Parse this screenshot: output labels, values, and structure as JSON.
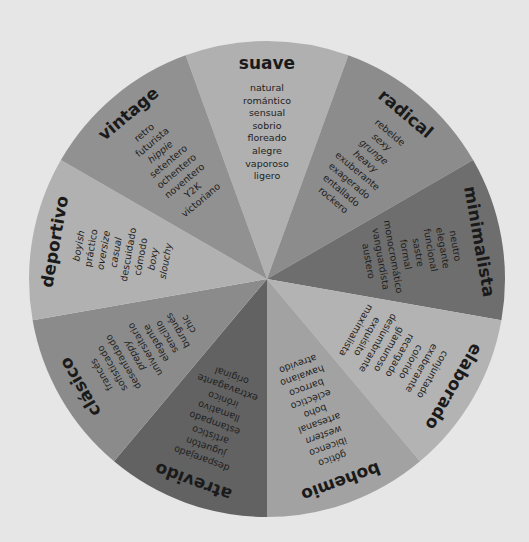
{
  "wheel": {
    "center": [
      267,
      279
    ],
    "radius": 238,
    "background": "#e6e6e6",
    "segments": [
      {
        "title": "suave",
        "angle": 0,
        "color": "#b0b0b0",
        "items": [
          {
            "t": "natural"
          },
          {
            "t": "romántico"
          },
          {
            "t": "sensual"
          },
          {
            "t": "sobrio"
          },
          {
            "t": "floreado"
          },
          {
            "t": "alegre"
          },
          {
            "t": "vaporoso"
          },
          {
            "t": "ligero"
          }
        ]
      },
      {
        "title": "radical",
        "angle": 40,
        "color": "#8c8c8c",
        "items": [
          {
            "t": "rebelde"
          },
          {
            "t": "sexy",
            "i": true
          },
          {
            "t": "grunge",
            "i": true
          },
          {
            "t": "heavy",
            "i": true
          },
          {
            "t": "exuberante"
          },
          {
            "t": "exagerado"
          },
          {
            "t": "entallado"
          },
          {
            "t": "rockero"
          }
        ]
      },
      {
        "title": "minimalista",
        "angle": 80,
        "color": "#6e6e6e",
        "items": [
          {
            "t": "neutro"
          },
          {
            "t": "elegante"
          },
          {
            "t": "funcional"
          },
          {
            "t": "sastre"
          },
          {
            "t": "formal"
          },
          {
            "t": "monocromático"
          },
          {
            "t": "vanguardista"
          },
          {
            "t": "austero"
          }
        ]
      },
      {
        "title": "elaborado",
        "angle": 120,
        "color": "#b3b3b3",
        "items": [
          {
            "t": "conjuntado"
          },
          {
            "t": "exuberante"
          },
          {
            "t": "colorido"
          },
          {
            "t": "recargado"
          },
          {
            "t": "glamuroso"
          },
          {
            "t": "deslumbrante"
          },
          {
            "t": "exquisito"
          },
          {
            "t": "maximalista"
          }
        ]
      },
      {
        "title": "bohemio",
        "angle": 160,
        "color": "#a2a2a2",
        "items": [
          {
            "t": "gótico"
          },
          {
            "t": "ibicenco"
          },
          {
            "t": "western",
            "i": true
          },
          {
            "t": "artesanal"
          },
          {
            "t": "boho"
          },
          {
            "t": "ecléctico"
          },
          {
            "t": "barroco"
          },
          {
            "t": "hawaiano"
          },
          {
            "t": "atrevido"
          }
        ]
      },
      {
        "title": "atrevido",
        "angle": 200,
        "color": "#626262",
        "items": [
          {
            "t": "desparejado"
          },
          {
            "t": "juguetón"
          },
          {
            "t": "artístico"
          },
          {
            "t": "estampado"
          },
          {
            "t": "llamativo"
          },
          {
            "t": "irónico"
          },
          {
            "t": "extravagante"
          },
          {
            "t": "original"
          }
        ]
      },
      {
        "title": "clásico",
        "angle": 240,
        "color": "#8b8b8b",
        "items": [
          {
            "t": "francés"
          },
          {
            "t": "sofisticado"
          },
          {
            "t": "desenfadado"
          },
          {
            "t": "preppy",
            "i": true
          },
          {
            "t": "universitario"
          },
          {
            "t": "elegante"
          },
          {
            "t": "sencillo"
          },
          {
            "t": "burgués"
          },
          {
            "t": "chic"
          }
        ]
      },
      {
        "title": "deportivo",
        "angle": 280,
        "color": "#b1b1b1",
        "items": [
          {
            "t": "boyish",
            "i": true
          },
          {
            "t": "práctico"
          },
          {
            "t": "oversize",
            "i": true
          },
          {
            "t": "casual",
            "i": true
          },
          {
            "t": "descuidado"
          },
          {
            "t": "cómodo"
          },
          {
            "t": "boxy",
            "i": true
          },
          {
            "t": "slouchy",
            "i": true
          }
        ]
      },
      {
        "title": "vintage",
        "angle": 320,
        "color": "#919191",
        "items": [
          {
            "t": "retro"
          },
          {
            "t": "futurista"
          },
          {
            "t": "hippie",
            "i": true
          },
          {
            "t": "setentero"
          },
          {
            "t": "ochentero"
          },
          {
            "t": "noventero"
          },
          {
            "t": "Y2K"
          },
          {
            "t": "victoriano"
          }
        ]
      }
    ]
  }
}
